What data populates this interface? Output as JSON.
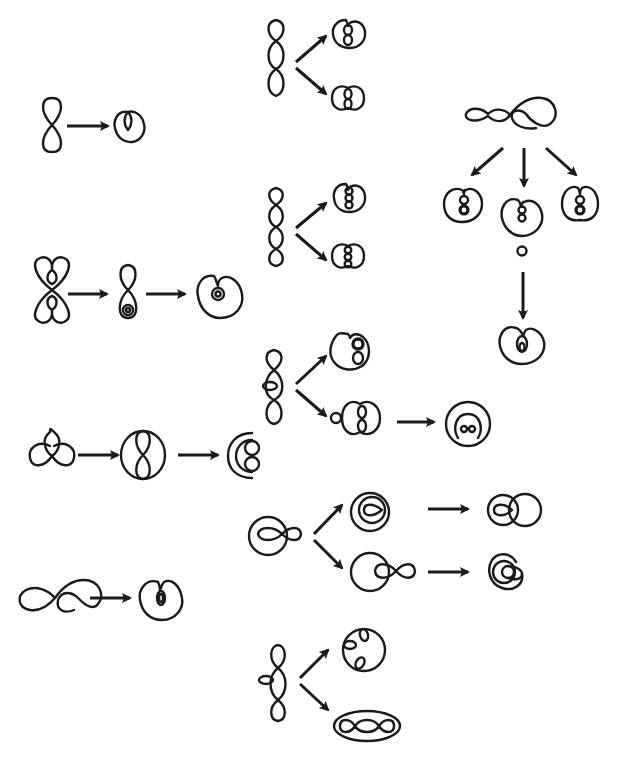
{
  "figure": {
    "background": "#ffffff",
    "ink": "#1a1a1a",
    "groups": [
      {
        "id": "g1",
        "source": "figure-eight",
        "arrows": 1,
        "results": [
          "circle-with-inner-loop"
        ]
      },
      {
        "id": "g2",
        "source": "two-heart-loops",
        "arrows": 2,
        "results": [
          "figure-eight-with-inner-loops",
          "circle-with-double-inner-loop"
        ]
      },
      {
        "id": "g3",
        "source": "trefoil",
        "arrows": 2,
        "results": [
          "circle-with-figure-eight",
          "crescent-with-two-loops"
        ]
      },
      {
        "id": "g4",
        "source": "infinity-with-heart",
        "arrows": 1,
        "results": [
          "circle-with-thick-inner-loop"
        ]
      },
      {
        "id": "g5",
        "source": "triple-chain",
        "arrows": 2,
        "results": [
          "circle-with-double-chain-a",
          "circle-with-double-chain-b"
        ]
      },
      {
        "id": "g6",
        "source": "quadruple-chain",
        "arrows": 2,
        "results": [
          "circle-with-triple-chain-a",
          "circle-with-triple-chain-b"
        ]
      },
      {
        "id": "g7",
        "source": "triple-chain-with-side-loop",
        "arrows": 3,
        "results": [
          "circle-with-figure-eight-knot",
          "circle-pair-with-side-loop",
          "circle-with-two-small-loops"
        ]
      },
      {
        "id": "g8",
        "source": "circle-with-figure-eight-tail",
        "arrows": 4,
        "results": [
          "nested-circles-with-loop",
          "overlapping-circles",
          "circle-with-figure-eight-right",
          "nested-spiral-circles"
        ]
      },
      {
        "id": "g9",
        "source": "double-chain-with-side-loop",
        "arrows": 2,
        "results": [
          "circle-with-three-inner-loops",
          "ellipse-around-triple-chain"
        ]
      },
      {
        "id": "g10",
        "source": "infinity-with-heart-chain",
        "arrows": 4,
        "results": [
          "circle-with-double-chain",
          "circle-with-chain-and-tail",
          "circle-with-chain-right",
          "circle-with-nested-inner-loop"
        ]
      }
    ]
  }
}
